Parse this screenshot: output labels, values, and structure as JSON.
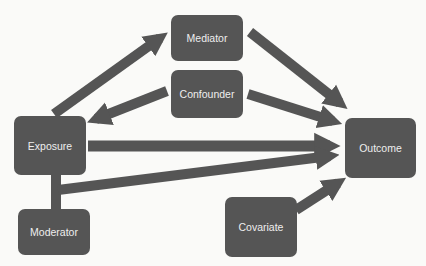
{
  "diagram": {
    "type": "causal-diagram",
    "colors": {
      "node": "#555555",
      "arrow": "#555555",
      "text": "#eeeeee",
      "background": "#fafaf8"
    },
    "nodes": {
      "mediator": {
        "label": "Mediator"
      },
      "confounder": {
        "label": "Confounder"
      },
      "exposure": {
        "label": "Exposure"
      },
      "outcome": {
        "label": "Outcome"
      },
      "moderator": {
        "label": "Moderator"
      },
      "covariate": {
        "label": "Covariate"
      }
    },
    "edges": [
      {
        "from": "Exposure",
        "to": "Mediator"
      },
      {
        "from": "Confounder",
        "to": "Exposure"
      },
      {
        "from": "Mediator",
        "to": "Outcome"
      },
      {
        "from": "Confounder",
        "to": "Outcome"
      },
      {
        "from": "Exposure",
        "to": "Outcome"
      },
      {
        "from": "Moderator",
        "to": "Outcome",
        "via": "Exposure-Moderator link"
      },
      {
        "from": "Covariate",
        "to": "Outcome"
      }
    ]
  }
}
